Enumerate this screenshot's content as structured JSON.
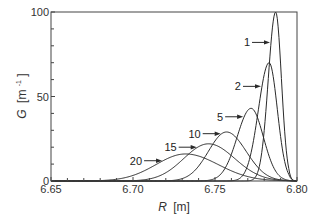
{
  "chart_data": {
    "type": "line",
    "title": "",
    "xlabel": "R [m]",
    "xlabel_var": "R",
    "xlabel_unit": "[m]",
    "ylabel": "G [m-1]",
    "ylabel_var": "G",
    "ylabel_unit": "[m",
    "ylabel_sup": "-1",
    "ylabel_close": "]",
    "xlim": [
      6.65,
      6.8
    ],
    "ylim": [
      0,
      100
    ],
    "x_ticks": [
      "6.65",
      "6.70",
      "6.75",
      "6.80"
    ],
    "x_tick_values": [
      6.65,
      6.7,
      6.75,
      6.8
    ],
    "y_ticks": [
      "0",
      "50",
      "100"
    ],
    "y_tick_values": [
      0,
      50,
      100
    ],
    "grid": false,
    "legend": "inline arrow labels",
    "series": [
      {
        "name": "1",
        "peak_R": 6.787,
        "peak_G": 100,
        "width_left": 0.0045,
        "width_right": 0.0035,
        "label_xy": [
          6.782,
          82
        ]
      },
      {
        "name": "2",
        "peak_R": 6.783,
        "peak_G": 70,
        "width_left": 0.0065,
        "width_right": 0.005,
        "label_xy": [
          6.778,
          56
        ]
      },
      {
        "name": "5",
        "peak_R": 6.772,
        "peak_G": 43,
        "width_left": 0.0085,
        "width_right": 0.0075,
        "label_xy": [
          6.764,
          38
        ]
      },
      {
        "name": "10",
        "peak_R": 6.757,
        "peak_G": 29,
        "width_left": 0.011,
        "width_right": 0.012,
        "label_xy": [
          6.75,
          28
        ]
      },
      {
        "name": "15",
        "peak_R": 6.746,
        "peak_G": 22,
        "width_left": 0.015,
        "width_right": 0.016,
        "label_xy": [
          6.733,
          20
        ]
      },
      {
        "name": "20",
        "peak_R": 6.732,
        "peak_G": 16,
        "width_left": 0.018,
        "width_right": 0.02,
        "label_xy": [
          6.708,
          12
        ]
      }
    ]
  },
  "colors": {
    "line": "#2a2a2a",
    "axis": "#444444",
    "text": "#333333",
    "background": "#ffffff"
  }
}
